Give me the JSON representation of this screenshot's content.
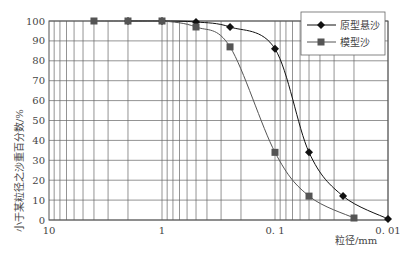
{
  "chart_data": {
    "type": "line",
    "title": "",
    "xlabel": "粒径/mm",
    "ylabel": "小于某粒径之沙重百分数/%",
    "x_scale": "log",
    "x_reversed": true,
    "xlim": [
      10,
      0.01
    ],
    "ylim": [
      0,
      100
    ],
    "x_tick_labels": [
      "10",
      "1",
      "0.1",
      "0.01"
    ],
    "y_tick_labels": [
      "0",
      "10",
      "20",
      "30",
      "40",
      "50",
      "60",
      "70",
      "80",
      "90",
      "100"
    ],
    "grid": true,
    "legend_position": "upper right",
    "series": [
      {
        "name": "原型悬沙",
        "marker": "diamond",
        "color": "#111111",
        "x": [
          2,
          1,
          0.5,
          0.25,
          0.1,
          0.05,
          0.025,
          0.01
        ],
        "y": [
          100,
          100,
          99.5,
          97,
          86,
          34,
          12,
          0.5
        ]
      },
      {
        "name": "模型沙",
        "marker": "square",
        "color": "#555555",
        "x": [
          4,
          2,
          1,
          0.5,
          0.25,
          0.1,
          0.05,
          0.02
        ],
        "y": [
          100,
          100,
          100,
          97,
          87,
          34,
          12,
          1
        ]
      }
    ]
  }
}
